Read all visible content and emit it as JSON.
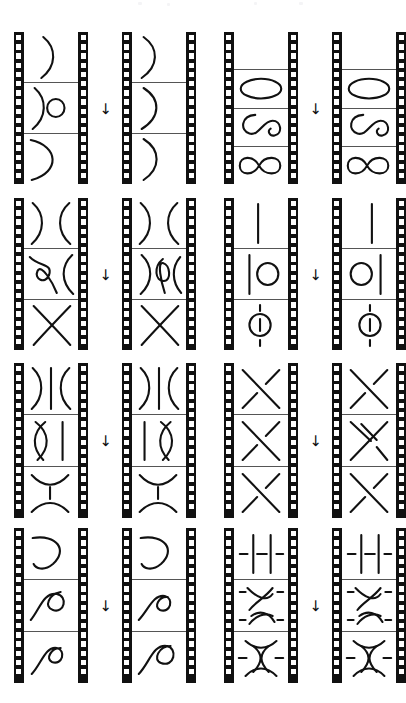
{
  "figure": {
    "caption": "",
    "background_color": "#ffffff",
    "ink_color": "#111111",
    "frame_line_color": "#555555",
    "arrow_glyph": "→",
    "arrow_label": "maps to",
    "orientation_note": "page rotated 90 degrees; arrows point downward on the page",
    "strip_count": 8,
    "row_count": 4,
    "pairs_per_row": 2
  },
  "rows": [
    {
      "id": "row-1",
      "left_pair": {
        "id": "pair-1a",
        "source": {
          "id": "strip-1",
          "frame_count": 3,
          "frames": [
            {
              "id": "f1",
              "label": "single-arc-right",
              "shapes": [
                "arc-c-open-left"
              ]
            },
            {
              "id": "f2",
              "label": "arc-and-circle",
              "shapes": [
                "arc-c-open-left",
                "small-circle"
              ]
            },
            {
              "id": "f3",
              "label": "wide-cap-arc",
              "shapes": [
                "wide-arc-open-left"
              ]
            }
          ]
        },
        "arrow": "→",
        "target": {
          "id": "strip-2",
          "frame_count": 3,
          "frames": [
            {
              "id": "f1",
              "label": "single-arc-right",
              "shapes": [
                "arc-c-open-left"
              ]
            },
            {
              "id": "f2",
              "label": "single-arc-right",
              "shapes": [
                "arc-c-open-left"
              ]
            },
            {
              "id": "f3",
              "label": "single-arc-right",
              "shapes": [
                "arc-c-open-left"
              ]
            }
          ]
        }
      },
      "right_pair": {
        "id": "pair-1b",
        "source": {
          "id": "strip-3",
          "frame_count": 4,
          "frames": [
            {
              "id": "f1",
              "label": "empty-frame",
              "shapes": []
            },
            {
              "id": "f2",
              "label": "ellipse",
              "shapes": [
                "ellipse"
              ]
            },
            {
              "id": "f3",
              "label": "figure-eight-open",
              "shapes": [
                "figure-eight-open"
              ]
            },
            {
              "id": "f4",
              "label": "figure-eight",
              "shapes": [
                "figure-eight"
              ]
            }
          ]
        },
        "arrow": "→",
        "target": {
          "id": "strip-4",
          "frame_count": 4,
          "frames": [
            {
              "id": "f1",
              "label": "empty-frame",
              "shapes": []
            },
            {
              "id": "f2",
              "label": "ellipse",
              "shapes": [
                "ellipse"
              ]
            },
            {
              "id": "f3",
              "label": "figure-eight-open",
              "shapes": [
                "figure-eight-open"
              ]
            },
            {
              "id": "f4",
              "label": "figure-eight",
              "shapes": [
                "figure-eight"
              ]
            }
          ]
        }
      }
    },
    {
      "id": "row-2",
      "left_pair": {
        "id": "pair-2a",
        "source": {
          "id": "strip-5",
          "frame_count": 3,
          "frames": [
            {
              "id": "f1",
              "label": "two-facing-arcs",
              "shapes": [
                "arc-open-left",
                "arc-open-right"
              ]
            },
            {
              "id": "f2",
              "label": "kink-and-arc",
              "shapes": [
                "kink-loop",
                "arc-open-right"
              ]
            },
            {
              "id": "f3",
              "label": "crossing-x",
              "shapes": [
                "crossing-x"
              ]
            }
          ]
        },
        "arrow": "→",
        "target": {
          "id": "strip-6",
          "frame_count": 3,
          "frames": [
            {
              "id": "f1",
              "label": "two-facing-arcs",
              "shapes": [
                "arc-open-left",
                "arc-open-right"
              ]
            },
            {
              "id": "f2",
              "label": "arc-tight-kink-arc",
              "shapes": [
                "arc-open-left",
                "tight-kink",
                "arc-open-right"
              ]
            },
            {
              "id": "f3",
              "label": "crossing-x",
              "shapes": [
                "crossing-x"
              ]
            }
          ]
        }
      },
      "right_pair": {
        "id": "pair-2b",
        "source": {
          "id": "strip-7",
          "frame_count": 3,
          "frames": [
            {
              "id": "f1",
              "label": "vertical-strand",
              "shapes": [
                "vertical-line"
              ]
            },
            {
              "id": "f2",
              "label": "strand-and-circle",
              "shapes": [
                "vertical-line-left",
                "circle-right"
              ]
            },
            {
              "id": "f3",
              "label": "circle-on-strand",
              "shapes": [
                "dashed-vertical",
                "circle-center"
              ]
            }
          ]
        },
        "arrow": "→",
        "target": {
          "id": "strip-8",
          "frame_count": 3,
          "frames": [
            {
              "id": "f1",
              "label": "vertical-strand",
              "shapes": [
                "vertical-line"
              ]
            },
            {
              "id": "f2",
              "label": "circle-and-strand",
              "shapes": [
                "circle-left",
                "vertical-line-right"
              ]
            },
            {
              "id": "f3",
              "label": "circle-on-strand",
              "shapes": [
                "dashed-vertical",
                "circle-center"
              ]
            }
          ]
        }
      }
    },
    {
      "id": "row-3",
      "left_pair": {
        "id": "pair-3a",
        "source": {
          "id": "strip-9",
          "frame_count": 3,
          "frames": [
            {
              "id": "f1",
              "label": "arc-line-arc",
              "shapes": [
                "arc-open-left",
                "vertical-line",
                "arc-open-right"
              ]
            },
            {
              "id": "f2",
              "label": "lens-and-line",
              "shapes": [
                "lens",
                "vertical-line-right"
              ]
            },
            {
              "id": "f3",
              "label": "two-arcs-dashed-line",
              "shapes": [
                "cap-arc",
                "dashed-vertical",
                "cup-arc"
              ]
            }
          ]
        },
        "arrow": "→",
        "target": {
          "id": "strip-10",
          "frame_count": 3,
          "frames": [
            {
              "id": "f1",
              "label": "arc-line-arc",
              "shapes": [
                "arc-open-left",
                "vertical-line",
                "arc-open-right"
              ]
            },
            {
              "id": "f2",
              "label": "line-and-lens",
              "shapes": [
                "vertical-line-left",
                "lens-right"
              ]
            },
            {
              "id": "f3",
              "label": "two-arcs-dashed-line",
              "shapes": [
                "cap-arc",
                "dashed-vertical",
                "cup-arc"
              ]
            }
          ]
        }
      },
      "right_pair": {
        "id": "pair-3b",
        "source": {
          "id": "strip-11",
          "frame_count": 3,
          "frames": [
            {
              "id": "f1",
              "label": "crossing-x-over",
              "shapes": [
                "crossing-x-over"
              ]
            },
            {
              "id": "f2",
              "label": "crossing-x-under",
              "shapes": [
                "crossing-x-under"
              ]
            },
            {
              "id": "f3",
              "label": "crossing-x-over",
              "shapes": [
                "crossing-x-over"
              ]
            }
          ]
        },
        "arrow": "→",
        "target": {
          "id": "strip-12",
          "frame_count": 3,
          "frames": [
            {
              "id": "f1",
              "label": "crossing-x-over",
              "shapes": [
                "crossing-x-over"
              ]
            },
            {
              "id": "f2",
              "label": "double-crossing",
              "shapes": [
                "double-crossing"
              ]
            },
            {
              "id": "f3",
              "label": "crossing-x-over",
              "shapes": [
                "crossing-x-over"
              ]
            }
          ]
        }
      }
    },
    {
      "id": "row-4",
      "left_pair": {
        "id": "pair-4a",
        "source": {
          "id": "strip-13",
          "frame_count": 3,
          "frames": [
            {
              "id": "f1",
              "label": "cap-arc-wide",
              "shapes": [
                "cap-arc-wide"
              ]
            },
            {
              "id": "f2",
              "label": "loop-with-tail",
              "shapes": [
                "loop-with-tail"
              ]
            },
            {
              "id": "f3",
              "label": "curl-small",
              "shapes": [
                "curl-small"
              ]
            }
          ]
        },
        "arrow": "→",
        "target": {
          "id": "strip-14",
          "frame_count": 3,
          "frames": [
            {
              "id": "f1",
              "label": "cap-arc-wide",
              "shapes": [
                "cap-arc-wide"
              ]
            },
            {
              "id": "f2",
              "label": "curl-small",
              "shapes": [
                "curl-small"
              ]
            },
            {
              "id": "f3",
              "label": "curl-large",
              "shapes": [
                "curl-large"
              ]
            }
          ]
        }
      },
      "right_pair": {
        "id": "pair-4b",
        "source": {
          "id": "strip-15",
          "frame_count": 3,
          "frames": [
            {
              "id": "f1",
              "label": "two-strands-dashed",
              "shapes": [
                "two-vertical-lines",
                "dashed-horizontal"
              ]
            },
            {
              "id": "f2",
              "label": "braid-crossing",
              "shapes": [
                "braid-crossing",
                "dashes"
              ]
            },
            {
              "id": "f3",
              "label": "braid-lens",
              "shapes": [
                "braid-lens",
                "dashes"
              ]
            }
          ]
        },
        "arrow": "→",
        "target": {
          "id": "strip-16",
          "frame_count": 3,
          "frames": [
            {
              "id": "f1",
              "label": "two-strands-dashed",
              "shapes": [
                "two-vertical-lines",
                "dashed-horizontal"
              ]
            },
            {
              "id": "f2",
              "label": "braid-crossing",
              "shapes": [
                "braid-crossing",
                "dashes"
              ]
            },
            {
              "id": "f3",
              "label": "braid-lens",
              "shapes": [
                "braid-lens",
                "dashes"
              ]
            }
          ]
        }
      }
    }
  ]
}
